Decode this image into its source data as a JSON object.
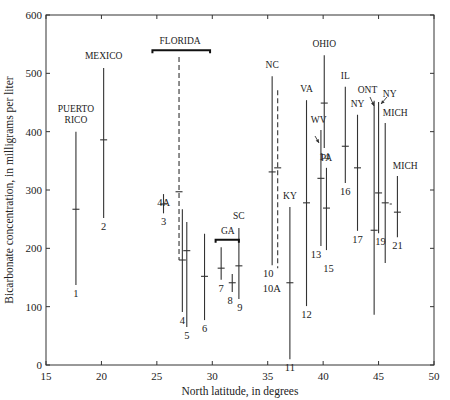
{
  "chart_data": {
    "type": "range",
    "title": "",
    "xlabel": "North latitude, in degrees",
    "ylabel": "Bicarbonate concentration, in milligrams per liter",
    "xlim": [
      15,
      50
    ],
    "ylim": [
      0,
      600
    ],
    "xticks": [
      15,
      20,
      25,
      30,
      35,
      40,
      45,
      50
    ],
    "yticks": [
      0,
      100,
      200,
      300,
      400,
      500,
      600
    ],
    "grid": false,
    "series": [
      {
        "id": "1",
        "region": "PUERTO RICO",
        "lat": 17.7,
        "max": 400,
        "min": 137,
        "mean": 267,
        "dashed": false
      },
      {
        "id": "2",
        "region": "MEXICO",
        "lat": 20.2,
        "max": 509,
        "min": 252,
        "mean": 386,
        "dashed": false
      },
      {
        "id": "3",
        "region": "FLORIDA",
        "lat": 25.6,
        "max": 293,
        "min": 260,
        "mean": 276,
        "dashed": false
      },
      {
        "id": "4A",
        "region": "FLORIDA",
        "lat": 27.0,
        "max": 528,
        "min": 180,
        "mean": 297,
        "dashed": true
      },
      {
        "id": "4",
        "region": "FLORIDA",
        "lat": 27.3,
        "max": 267,
        "min": 91,
        "mean": 180,
        "dashed": false
      },
      {
        "id": "5",
        "region": "FLORIDA",
        "lat": 27.7,
        "max": 245,
        "min": 65,
        "mean": 196,
        "dashed": false
      },
      {
        "id": "6",
        "region": "FLORIDA",
        "lat": 29.3,
        "max": 225,
        "min": 77,
        "mean": 152,
        "dashed": false
      },
      {
        "id": "7",
        "region": "GA",
        "lat": 30.8,
        "max": 202,
        "min": 146,
        "mean": 166,
        "dashed": false
      },
      {
        "id": "8",
        "region": "GA",
        "lat": 31.8,
        "max": 156,
        "min": 125,
        "mean": 141,
        "dashed": false
      },
      {
        "id": "9",
        "region": "SC",
        "lat": 32.4,
        "max": 235,
        "min": 113,
        "mean": 170,
        "dashed": false
      },
      {
        "id": "10",
        "region": "NC",
        "lat": 35.4,
        "max": 495,
        "min": 171,
        "mean": 331,
        "dashed": false
      },
      {
        "id": "10A",
        "region": "NC",
        "lat": 35.9,
        "max": 471,
        "min": 166,
        "mean": 338,
        "dashed": true
      },
      {
        "id": "11",
        "region": "KY",
        "lat": 37.0,
        "max": 271,
        "min": 10,
        "mean": 141,
        "dashed": false
      },
      {
        "id": "12",
        "region": "VA",
        "lat": 38.5,
        "max": 454,
        "min": 101,
        "mean": 278,
        "dashed": false
      },
      {
        "id": "13",
        "region": "WV",
        "lat": 39.8,
        "max": 403,
        "min": 204,
        "mean": 320,
        "dashed": false
      },
      {
        "id": "14",
        "region": "OHIO",
        "lat": 40.1,
        "max": 531,
        "min": 372,
        "mean": 449,
        "dashed": false
      },
      {
        "id": "15",
        "region": "PA",
        "lat": 40.3,
        "max": 338,
        "min": 197,
        "mean": 269,
        "dashed": false
      },
      {
        "id": "16",
        "region": "IL",
        "lat": 42.0,
        "max": 477,
        "min": 312,
        "mean": 375,
        "dashed": false
      },
      {
        "id": "17",
        "region": "NY",
        "lat": 43.1,
        "max": 429,
        "min": 230,
        "mean": 338,
        "dashed": false
      },
      {
        "id": "18",
        "region": "ONT",
        "lat": 44.6,
        "max": 453,
        "min": 86,
        "mean": 231,
        "dashed": false
      },
      {
        "id": "19",
        "region": "NY",
        "lat": 45.0,
        "max": 451,
        "min": 226,
        "mean": 295,
        "dashed": false
      },
      {
        "id": "20",
        "region": "MICH",
        "lat": 45.6,
        "max": 415,
        "min": 175,
        "mean": 278,
        "dashed": false
      },
      {
        "id": "21",
        "region": "MICH",
        "lat": 46.7,
        "max": 324,
        "min": 219,
        "mean": 262,
        "dashed": false
      }
    ],
    "annotations": [
      {
        "text": "PUERTO RICO",
        "lat": 17.7,
        "y": 430
      },
      {
        "text": "MEXICO",
        "lat": 20.2,
        "y": 525
      },
      {
        "text": "FLORIDA",
        "lat": 27.1,
        "y": 550,
        "bracket": [
          24.6,
          29.8
        ]
      },
      {
        "text": "GA",
        "lat": 31.4,
        "y": 225,
        "bracket": [
          30.3,
          32.4
        ]
      },
      {
        "text": "SC",
        "lat": 32.4,
        "y": 250
      },
      {
        "text": "NC",
        "lat": 35.4,
        "y": 510
      },
      {
        "text": "KY",
        "lat": 37.0,
        "y": 285
      },
      {
        "text": "VA",
        "lat": 38.5,
        "y": 468
      },
      {
        "text": "WV",
        "lat": 39.6,
        "y": 415
      },
      {
        "text": "OHIO",
        "lat": 40.1,
        "y": 545
      },
      {
        "text": "PA",
        "lat": 40.3,
        "y": 350
      },
      {
        "text": "IL",
        "lat": 42.0,
        "y": 490
      },
      {
        "text": "NY",
        "lat": 43.1,
        "y": 442
      },
      {
        "text": "ONT",
        "lat": 44.0,
        "y": 467
      },
      {
        "text": "NY",
        "lat": 46.0,
        "y": 460
      },
      {
        "text": "MICH",
        "lat": 46.5,
        "y": 427
      },
      {
        "text": "MICH",
        "lat": 47.4,
        "y": 336
      }
    ]
  }
}
